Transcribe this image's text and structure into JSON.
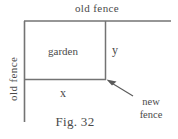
{
  "figure": {
    "caption": "Fig. 32",
    "labels": {
      "old_fence_top": "old fence",
      "old_fence_left": "old fence",
      "garden": "garden",
      "side_y": "y",
      "side_x": "x",
      "new_fence_line1": "new",
      "new_fence_line2": "fence"
    },
    "colors": {
      "line": "#737373",
      "text": "#4a4a4a",
      "background": "#ffffff",
      "arrow": "#5a5a5a"
    },
    "geometry": {
      "old_fence_top_line": {
        "x1": 24,
        "y1": 21,
        "x2": 171,
        "y2": 21
      },
      "old_fence_left_line": {
        "x1": 24,
        "y1": 21,
        "x2": 24,
        "y2": 122
      },
      "garden_right_line": {
        "x1": 105,
        "y1": 21,
        "x2": 105,
        "y2": 79
      },
      "garden_bottom_line": {
        "x1": 24,
        "y1": 79,
        "x2": 105,
        "y2": 79
      },
      "arrow": {
        "x1": 133,
        "y1": 96,
        "x2": 108,
        "y2": 81
      }
    }
  }
}
